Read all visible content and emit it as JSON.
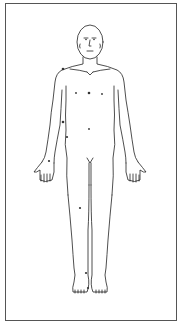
{
  "diagram": {
    "type": "body-chart",
    "view": "anterior",
    "colors": {
      "line": "#222222",
      "frame": "#555555",
      "background": "#ffffff",
      "mark": "#333333"
    },
    "marks": [
      {
        "id": "left-shoulder",
        "x": 63,
        "y": 69
      },
      {
        "id": "chest-left",
        "x": 76,
        "y": 93
      },
      {
        "id": "chest-center",
        "x": 89,
        "y": 93
      },
      {
        "id": "chest-right",
        "x": 102,
        "y": 94
      },
      {
        "id": "upper-arm",
        "x": 63,
        "y": 122
      },
      {
        "id": "abdomen",
        "x": 89,
        "y": 129
      },
      {
        "id": "forearm",
        "x": 67,
        "y": 137
      },
      {
        "id": "wrist",
        "x": 49,
        "y": 161
      },
      {
        "id": "thigh",
        "x": 80,
        "y": 208
      },
      {
        "id": "ankle",
        "x": 86,
        "y": 273
      },
      {
        "id": "foot",
        "x": 88,
        "y": 288
      }
    ]
  }
}
